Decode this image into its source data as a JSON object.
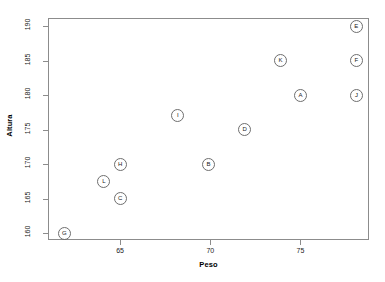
{
  "chart_data": {
    "type": "scatter",
    "title": "",
    "xlabel": "Peso",
    "ylabel": "Altura",
    "xlim": [
      61.0,
      78.8
    ],
    "ylim": [
      159.0,
      191.2
    ],
    "xticks": [
      65,
      70,
      75
    ],
    "yticks": [
      160,
      165,
      170,
      175,
      180,
      185,
      190
    ],
    "grid": false,
    "legend": "none",
    "point_style": "open-circle-with-letter-label",
    "points": [
      {
        "label": "G",
        "x": 61.9,
        "y": 160.0
      },
      {
        "label": "L",
        "x": 64.1,
        "y": 167.5
      },
      {
        "label": "C",
        "x": 65.0,
        "y": 165.0
      },
      {
        "label": "H",
        "x": 65.0,
        "y": 170.0
      },
      {
        "label": "I",
        "x": 68.2,
        "y": 177.0
      },
      {
        "label": "B",
        "x": 69.9,
        "y": 170.0
      },
      {
        "label": "D",
        "x": 71.9,
        "y": 175.0
      },
      {
        "label": "K",
        "x": 73.9,
        "y": 185.0
      },
      {
        "label": "A",
        "x": 75.0,
        "y": 180.0
      },
      {
        "label": "E",
        "x": 78.1,
        "y": 190.0
      },
      {
        "label": "F",
        "x": 78.1,
        "y": 185.0
      },
      {
        "label": "J",
        "x": 78.1,
        "y": 180.0
      }
    ]
  },
  "axes": {
    "x_tick_labels": [
      "65",
      "70",
      "75"
    ],
    "y_tick_labels": [
      "160",
      "165",
      "170",
      "175",
      "180",
      "185",
      "190"
    ],
    "x_title": "Peso",
    "y_title": "Altura"
  },
  "colors": {
    "background": "#ffffff",
    "axis": "#8c8c8c",
    "point_stroke": "#6e6e6e",
    "text": "#1a1a1a"
  }
}
